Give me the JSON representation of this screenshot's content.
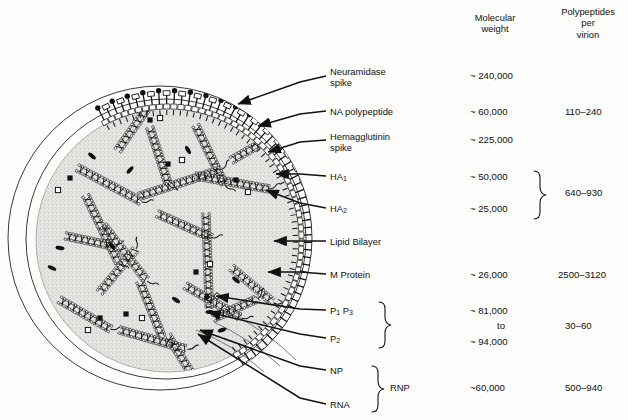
{
  "figure": {
    "columns": {
      "molecular_weight_header": "Molecular\nweight",
      "polypeptides_header": "Polypeptides\nper\nvirion"
    }
  },
  "rows": [
    {
      "label": "Neuramidase\nspike",
      "mw": "~ 240,000",
      "count": ""
    },
    {
      "label": "NA polypeptide",
      "mw": "~ 60,000",
      "count": "110–240"
    },
    {
      "label": "Hemagglutinin\nspike",
      "mw": "~ 225,000",
      "count": ""
    },
    {
      "label": "HA",
      "sub": "1",
      "mw": "~ 50,000",
      "count": ""
    },
    {
      "label": "HA",
      "sub": "2",
      "mw": "~ 25,000",
      "count": "640–930"
    },
    {
      "label": "Lipid Bilayer",
      "mw": "",
      "count": ""
    },
    {
      "label": "M Protein",
      "mw": "~ 26,000",
      "count": "2500–3120"
    },
    {
      "label": "P",
      "sub": "1",
      "label2": "P",
      "sub2": "3",
      "mw": "~ 81,000",
      "count": ""
    },
    {
      "label": "to_connector",
      "mw": "to",
      "count": "30–60"
    },
    {
      "label": "P",
      "sub": "2",
      "mw": "~ 94,000",
      "count": ""
    },
    {
      "label": "NP",
      "mw": "",
      "count": ""
    },
    {
      "label": "RNA",
      "mw": "~ 60,000",
      "count": "500–940"
    }
  ],
  "group_labels": {
    "rnp": "RNP"
  },
  "colors": {
    "ink": "#111111",
    "core_fill": "#e8e8e6",
    "stipple": "#8a8a86",
    "spike_dark": "#101010",
    "spike_open": "#ffffff"
  },
  "text": {
    "hdr_mw": "Molecular\nweight",
    "hdr_pp": "Polypeptides\nper\nvirion",
    "r0_label": "Neuramidase\nspike",
    "r0_mw": "~ 240,000",
    "r1_label": "NA polypeptide",
    "r1_mw": "~ 60,000",
    "r1_count": "110–240",
    "r2_label": "Hemagglutinin\nspike",
    "r2_mw": "~ 225,000",
    "r3_label": "HA",
    "r3_sub": "1",
    "r3_mw": "~ 50,000",
    "r4_label": "HA",
    "r4_sub": "2",
    "r4_mw": "~ 25,000",
    "r34_count": "640–930",
    "r5_label": "Lipid Bilayer",
    "r6_label": "M Protein",
    "r6_mw": "~ 26,000",
    "r6_count": "2500–3120",
    "r7_label": "P",
    "r7_sub": "1",
    "r7_label_b": "P",
    "r7_sub_b": "3",
    "r7_mw": "~ 81,000",
    "r7_mid": "to",
    "r8_label": "P",
    "r8_sub": "2",
    "r8_mw": "~ 94,000",
    "r78_count": "30–60",
    "r9_label": "NP",
    "r10_label": "RNA",
    "rnp": "RNP",
    "rnp_mw": "~60,000",
    "rnp_count": "500–940"
  }
}
